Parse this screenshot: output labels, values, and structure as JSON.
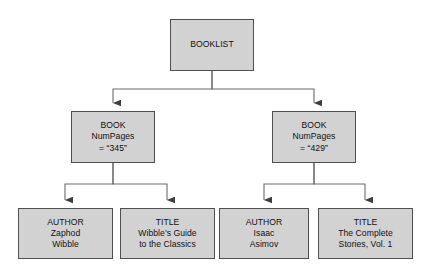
{
  "diagram": {
    "type": "tree",
    "background_color": "#ffffff",
    "node_fill_color": "#d2d2d2",
    "node_border_color": "#4f4f4f",
    "edge_color": "#6b6b6b",
    "text_color": "#111111"
  },
  "nodes": {
    "root": {
      "id": "booklist",
      "lines": [
        "BOOKLIST"
      ],
      "line1": "BOOKLIST"
    },
    "book1": {
      "id": "book-1",
      "line1": "BOOK",
      "line2": "NumPages",
      "line3": "= “345”"
    },
    "book2": {
      "id": "book-2",
      "line1": "BOOK",
      "line2": "NumPages",
      "line3": "= “429”"
    },
    "author1": {
      "id": "author-1",
      "line1": "AUTHOR",
      "line2": "Zaphod",
      "line3": "Wibble"
    },
    "title1": {
      "id": "title-1",
      "line1": "TITLE",
      "line2": "Wibble’s Guide",
      "line3": "to the Classics"
    },
    "author2": {
      "id": "author-2",
      "line1": "AUTHOR",
      "line2": "Isaac",
      "line3": "Asimov"
    },
    "title2": {
      "id": "title-2",
      "line1": "TITLE",
      "line2": "The Complete",
      "line3": "Stories, Vol. 1"
    }
  },
  "edges": [
    {
      "from": "booklist",
      "to": "book-1"
    },
    {
      "from": "booklist",
      "to": "book-2"
    },
    {
      "from": "book-1",
      "to": "author-1"
    },
    {
      "from": "book-1",
      "to": "title-1"
    },
    {
      "from": "book-2",
      "to": "author-2"
    },
    {
      "from": "book-2",
      "to": "title-2"
    }
  ]
}
